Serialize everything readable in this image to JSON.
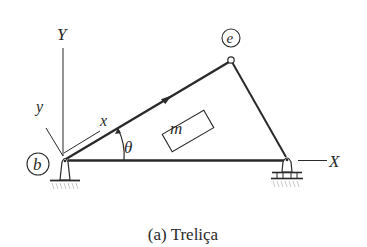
{
  "figure": {
    "caption": "(a) Treliça",
    "nodes": [
      {
        "id": "b",
        "label": "b",
        "support": "pinned"
      },
      {
        "id": "e",
        "label": "e",
        "support": "none"
      },
      {
        "id": "c",
        "label": "",
        "support": "roller"
      }
    ],
    "members": [
      {
        "from": "b",
        "to": "e",
        "arrow": "toward e"
      },
      {
        "from": "e",
        "to": "c"
      },
      {
        "from": "b",
        "to": "c"
      }
    ],
    "global_axes": {
      "x_label": "X",
      "y_label": "Y"
    },
    "local_axes": {
      "x_label": "x",
      "y_label": "y"
    },
    "angle_label": "θ",
    "element_label": "m",
    "colors": {
      "line": "#2a2a2a",
      "background": "#ffffff",
      "ground_hatch": "#c8c8c8"
    }
  }
}
